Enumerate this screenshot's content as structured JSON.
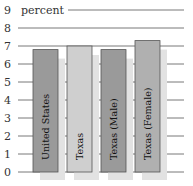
{
  "chart_data": {
    "type": "bar",
    "title": "",
    "ylabel": "percent",
    "xlabel": "",
    "ylim": [
      0,
      9
    ],
    "yticks": [
      "0",
      "1",
      "2",
      "3",
      "4",
      "5",
      "6",
      "7",
      "8",
      "9"
    ],
    "grid": true,
    "categories": [
      "United States",
      "Texas",
      "Texas (Male)",
      "Texas (Female)"
    ],
    "values": [
      6.8,
      7.0,
      6.8,
      7.3
    ],
    "colors": [
      "#9a9a9a",
      "#cfcfcf",
      "#9a9a9a",
      "#b0b0b0"
    ]
  }
}
